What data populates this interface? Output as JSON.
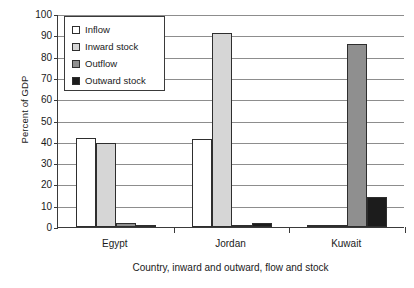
{
  "chart_data": {
    "type": "bar",
    "title": "",
    "subtitle": "",
    "xlabel": "Country, inward and outward, flow and stock",
    "ylabel": "Percent of GDP",
    "categories": [
      "Egypt",
      "Jordan",
      "Kuwait"
    ],
    "series": [
      {
        "name": "Inflow",
        "values": [
          42,
          41.5,
          0.5
        ],
        "color": "#ffffff"
      },
      {
        "name": "Inward stock",
        "values": [
          39.5,
          91,
          0.5
        ],
        "color": "#d6d6d6"
      },
      {
        "name": "Outflow",
        "values": [
          2,
          0.5,
          86
        ],
        "color": "#8f8f8f"
      },
      {
        "name": "Outward stock",
        "values": [
          1,
          2,
          14
        ],
        "color": "#1c1c1c"
      }
    ],
    "ylim": [
      0,
      100
    ],
    "yticks": [
      0,
      10,
      20,
      30,
      40,
      50,
      60,
      70,
      80,
      90,
      100
    ],
    "grid": true,
    "legend_position": "top-left",
    "legend_entries": [
      "Inflow",
      "Inward stock",
      "Outflow",
      "Outward stock"
    ]
  },
  "axes": {
    "y_title": "Percent of GDP",
    "x_title": "Country, inward and outward, flow and stock"
  }
}
